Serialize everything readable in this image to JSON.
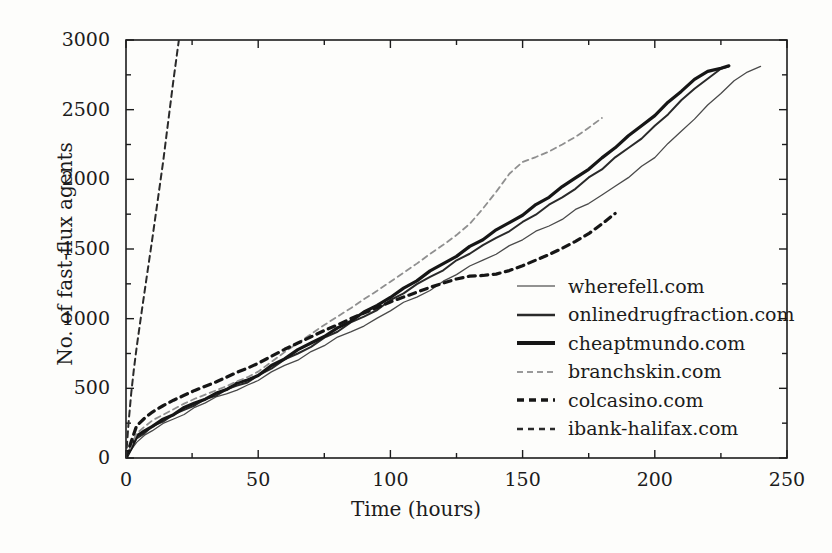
{
  "chart_data": {
    "type": "line",
    "title": "",
    "xlabel": "Time (hours)",
    "ylabel": "No. of fast-flux agents",
    "xlim": [
      0,
      250
    ],
    "ylim": [
      0,
      3000
    ],
    "xticks": [
      0,
      50,
      100,
      150,
      200,
      250
    ],
    "yticks": [
      0,
      500,
      1000,
      1500,
      2000,
      2500,
      3000
    ],
    "xminor_step": 25,
    "yminor_step": 250,
    "grid": false,
    "legend_position": "center-right",
    "series": [
      {
        "name": "wherefell.com",
        "style": "solid",
        "width": 1.3,
        "color": "#4a4a4a",
        "x": [
          0,
          2,
          4,
          7,
          10,
          14,
          18,
          22,
          26,
          30,
          34,
          38,
          42,
          46,
          50,
          55,
          60,
          65,
          70,
          75,
          80,
          85,
          90,
          95,
          100,
          105,
          110,
          115,
          120,
          125,
          130,
          135,
          140,
          145,
          150,
          155,
          160,
          165,
          170,
          175,
          180,
          185,
          190,
          195,
          200,
          205,
          210,
          215,
          220,
          225,
          230,
          235,
          240
        ],
        "y": [
          0,
          60,
          120,
          160,
          200,
          240,
          280,
          320,
          360,
          400,
          430,
          460,
          495,
          520,
          560,
          610,
          665,
          710,
          760,
          810,
          860,
          905,
          955,
          1000,
          1060,
          1110,
          1155,
          1210,
          1265,
          1320,
          1370,
          1420,
          1470,
          1520,
          1570,
          1620,
          1665,
          1720,
          1780,
          1830,
          1880,
          1950,
          2020,
          2090,
          2160,
          2250,
          2345,
          2440,
          2530,
          2620,
          2700,
          2770,
          2810
        ]
      },
      {
        "name": "onlinedrugfraction.com",
        "style": "solid",
        "width": 2.0,
        "color": "#2a2a2a",
        "x": [
          0,
          2,
          4,
          7,
          10,
          14,
          18,
          22,
          26,
          30,
          34,
          38,
          42,
          46,
          50,
          55,
          60,
          65,
          70,
          75,
          80,
          85,
          90,
          95,
          100,
          105,
          110,
          115,
          120,
          125,
          130,
          135,
          140,
          145,
          150,
          155,
          160,
          165,
          170,
          175,
          180,
          185,
          190,
          195,
          200,
          205,
          210,
          215,
          220,
          225,
          228
        ],
        "y": [
          0,
          70,
          140,
          185,
          225,
          265,
          305,
          345,
          385,
          420,
          450,
          485,
          520,
          550,
          590,
          645,
          700,
          750,
          805,
          860,
          910,
          965,
          1015,
          1070,
          1130,
          1185,
          1240,
          1300,
          1355,
          1415,
          1470,
          1520,
          1580,
          1635,
          1690,
          1750,
          1810,
          1870,
          1940,
          2010,
          2075,
          2150,
          2225,
          2300,
          2380,
          2470,
          2560,
          2650,
          2730,
          2790,
          2810
        ]
      },
      {
        "name": "cheaptmundo.com",
        "style": "solid",
        "width": 3.2,
        "color": "#161616",
        "x": [
          0,
          2,
          4,
          7,
          10,
          14,
          18,
          22,
          26,
          30,
          34,
          38,
          42,
          46,
          50,
          55,
          60,
          65,
          70,
          75,
          80,
          85,
          90,
          95,
          100,
          105,
          110,
          115,
          120,
          125,
          130,
          135,
          140,
          145,
          150,
          155,
          160,
          165,
          170,
          175,
          180,
          185,
          190,
          195,
          200,
          205,
          210,
          215,
          220,
          225,
          228
        ],
        "y": [
          0,
          75,
          150,
          195,
          235,
          275,
          315,
          355,
          395,
          430,
          460,
          495,
          530,
          560,
          600,
          660,
          715,
          770,
          825,
          880,
          930,
          985,
          1040,
          1095,
          1160,
          1215,
          1275,
          1335,
          1395,
          1455,
          1515,
          1570,
          1630,
          1690,
          1750,
          1815,
          1875,
          1940,
          2010,
          2080,
          2150,
          2230,
          2305,
          2385,
          2465,
          2550,
          2635,
          2710,
          2775,
          2805,
          2815
        ]
      },
      {
        "name": "branchskin.com",
        "style": "dashed-light",
        "width": 1.8,
        "color": "#8f8f8f",
        "x": [
          0,
          2,
          4,
          7,
          10,
          14,
          18,
          22,
          26,
          30,
          34,
          38,
          42,
          46,
          50,
          55,
          60,
          65,
          70,
          75,
          80,
          85,
          90,
          95,
          100,
          105,
          110,
          115,
          120,
          125,
          130,
          135,
          140,
          145,
          150,
          155,
          160,
          165,
          170,
          175,
          180
        ],
        "y": [
          0,
          90,
          175,
          225,
          270,
          310,
          350,
          390,
          425,
          455,
          485,
          515,
          550,
          580,
          620,
          690,
          760,
          825,
          890,
          955,
          1015,
          1075,
          1140,
          1200,
          1265,
          1330,
          1395,
          1465,
          1530,
          1600,
          1680,
          1790,
          1910,
          2040,
          2125,
          2160,
          2200,
          2250,
          2305,
          2370,
          2440
        ]
      },
      {
        "name": "colcasino.com",
        "style": "dashed-heavy",
        "width": 3.2,
        "color": "#161616",
        "x": [
          0,
          2,
          4,
          7,
          10,
          14,
          18,
          22,
          26,
          30,
          34,
          38,
          42,
          46,
          50,
          55,
          60,
          65,
          70,
          75,
          80,
          85,
          90,
          95,
          100,
          105,
          110,
          115,
          120,
          125,
          130,
          135,
          140,
          145,
          150,
          155,
          160,
          165,
          170,
          175,
          180,
          185
        ],
        "y": [
          0,
          120,
          230,
          285,
          330,
          375,
          415,
          450,
          485,
          515,
          545,
          580,
          615,
          645,
          680,
          730,
          780,
          825,
          870,
          915,
          955,
          1000,
          1040,
          1080,
          1120,
          1155,
          1190,
          1225,
          1255,
          1285,
          1305,
          1310,
          1320,
          1345,
          1380,
          1420,
          1460,
          1505,
          1555,
          1610,
          1680,
          1755
        ]
      },
      {
        "name": "ibank-halifax.com",
        "style": "dashed-thin",
        "width": 2.0,
        "color": "#2a2a2a",
        "x": [
          0,
          1,
          2,
          3,
          4,
          6,
          8,
          10,
          12,
          14,
          16,
          18,
          20
        ],
        "y": [
          0,
          260,
          470,
          640,
          790,
          1060,
          1320,
          1580,
          1850,
          2120,
          2420,
          2720,
          3000
        ]
      }
    ]
  },
  "axes": {
    "x_tick_labels": [
      "0",
      "50",
      "100",
      "150",
      "200",
      "250"
    ],
    "y_tick_labels": [
      "0",
      "500",
      "1000",
      "1500",
      "2000",
      "2500",
      "3000"
    ],
    "x_axis_title": "Time (hours)",
    "y_axis_title": "No. of fast-flux agents"
  },
  "legend": {
    "items": [
      {
        "label": "wherefell.com",
        "swatch": "solid-thin-gray"
      },
      {
        "label": "onlinedrugfraction.com",
        "swatch": "solid-medium-dark"
      },
      {
        "label": "cheaptmundo.com",
        "swatch": "solid-thick-black"
      },
      {
        "label": "branchskin.com",
        "swatch": "dashed-light-gray"
      },
      {
        "label": "colcasino.com",
        "swatch": "dashed-thick-black"
      },
      {
        "label": "ibank-halifax.com",
        "swatch": "dashed-medium-dark"
      }
    ]
  },
  "colors": {
    "background": "#fdfdfb",
    "axis": "#1c1c1c",
    "text": "#1c1c1c",
    "light_gray_series": "#8f8f8f",
    "mid_gray_series": "#4a4a4a",
    "black_series": "#161616"
  }
}
